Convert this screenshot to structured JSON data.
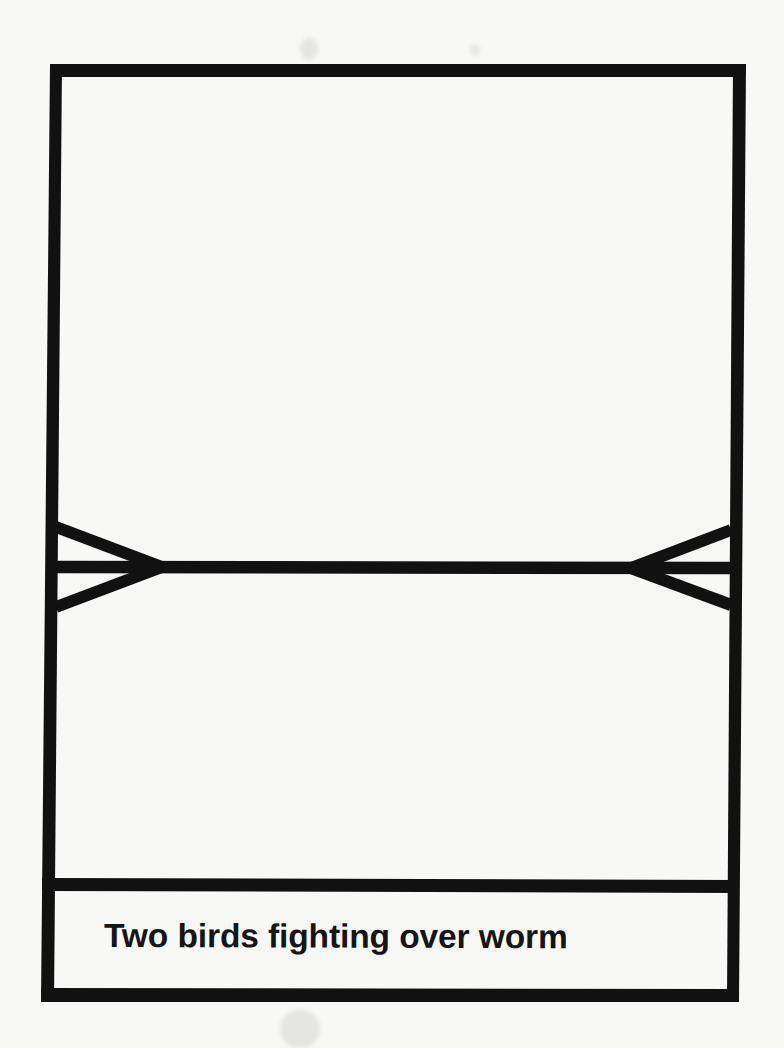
{
  "card": {
    "caption": "Two birds fighting over worm",
    "frame_color": "#111111",
    "background_color": "#f8f8f7"
  },
  "illustration": {
    "left_bird": {
      "shape": "arrow-fork",
      "apex": [
        160,
        567
      ],
      "upper_end": [
        56,
        527
      ],
      "lower_end": [
        56,
        607
      ]
    },
    "right_bird": {
      "shape": "arrow-fork",
      "apex": [
        633,
        568
      ],
      "upper_end": [
        729,
        530
      ],
      "lower_end": [
        729,
        605
      ]
    },
    "worm": {
      "shape": "horizontal-line",
      "y": 567
    }
  }
}
